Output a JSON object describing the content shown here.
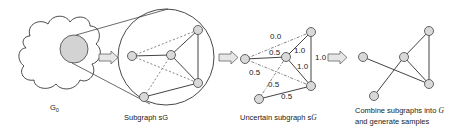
{
  "stages": [
    {
      "id": "g0",
      "label": "G",
      "subscript": "0"
    },
    {
      "id": "subgraph",
      "label": "Subgraph sG"
    },
    {
      "id": "uncertain",
      "label": "Uncertain subgraph s",
      "script_symbol": "G"
    },
    {
      "id": "combine",
      "label_line1": "Combine subgraphs into ",
      "script_symbol": "G",
      "label_line2": "and generate samples"
    }
  ],
  "edge_probabilities": {
    "A_C": "0.0",
    "A_B": "0.5",
    "A_D": "0.5",
    "E_B": "0.5",
    "B_C": "1.0",
    "B_D": "1.0",
    "C_D": "1.0",
    "E_D": "0.5"
  },
  "colors": {
    "node_fill": "#d9d9d9",
    "node_stroke": "#555555",
    "highlight_fill": "#d3d3d3",
    "arrow_fill": "#e6e6e6"
  }
}
